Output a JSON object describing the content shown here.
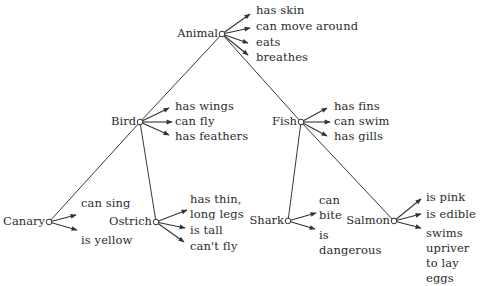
{
  "diagram": {
    "type": "semantic-network hierarchy",
    "nodes": {
      "animal": {
        "label": "Animal",
        "properties": [
          "has skin",
          "can move around",
          "eats",
          "breathes"
        ]
      },
      "bird": {
        "label": "Bird",
        "properties": [
          "has wings",
          "can fly",
          "has feathers"
        ]
      },
      "fish": {
        "label": "Fish",
        "properties": [
          "has fins",
          "can swim",
          "has gills"
        ]
      },
      "canary": {
        "label": "Canary",
        "properties": [
          "can sing",
          "is yellow"
        ]
      },
      "ostrich": {
        "label": "Ostrich",
        "properties": [
          "has thin,\nlong legs",
          "is tall",
          "can't fly"
        ]
      },
      "shark": {
        "label": "Shark",
        "properties": [
          "can\nbite",
          "is\ndangerous"
        ]
      },
      "salmon": {
        "label": "Salmon",
        "properties": [
          "is pink",
          "is edible",
          "swims\nupriver\nto lay\neggs"
        ]
      }
    },
    "edges": [
      {
        "from": "Animal",
        "to": "Bird"
      },
      {
        "from": "Animal",
        "to": "Fish"
      },
      {
        "from": "Bird",
        "to": "Canary"
      },
      {
        "from": "Bird",
        "to": "Ostrich"
      },
      {
        "from": "Fish",
        "to": "Shark"
      },
      {
        "from": "Fish",
        "to": "Salmon"
      }
    ],
    "colors": {
      "line": "#333333",
      "text": "#2b2b2b",
      "background": "#ffffff"
    }
  }
}
